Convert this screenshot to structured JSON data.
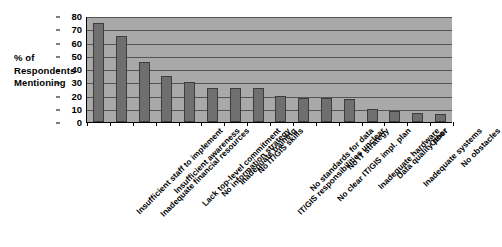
{
  "chart_data": {
    "type": "bar",
    "title": "",
    "xlabel": "",
    "ylabel": "% of Respondents Mentioning",
    "ylim": [
      0,
      80
    ],
    "ytick_step": 10,
    "yticks": [
      0,
      10,
      20,
      30,
      40,
      50,
      60,
      70,
      80
    ],
    "grid": true,
    "legend": "none",
    "bar_color": "#6f6f6f",
    "plot_background": "#a9a9a9",
    "categories": [
      "Insufficient staff to implement",
      "Inadequate financial resources",
      "Insufficient awareness",
      "Lack top-level commitment",
      "No information strategy",
      "Inadequate training",
      "No IT/GIS skills",
      "IT/GIS responsibilities unclear",
      "No standards for data",
      "No clear IT/GIS impl. plan",
      "No IT strategy",
      "Inadequate hardware",
      "Data quality poor",
      "Inadequate systems",
      "Other",
      "No obstacles"
    ],
    "values": [
      75,
      65,
      45,
      35,
      30,
      26,
      26,
      26,
      20,
      18,
      18,
      17,
      10,
      8,
      7,
      6
    ]
  },
  "axis": {
    "y_caption_lines": [
      "% of",
      "Respondents",
      "Mentioning"
    ]
  }
}
